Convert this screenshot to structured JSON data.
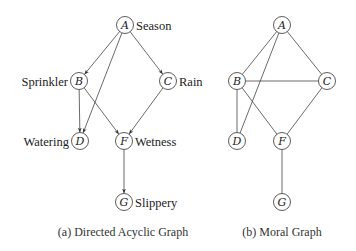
{
  "dag": {
    "caption": "(a) Directed Acyclic Graph",
    "nodes": [
      {
        "id": "A",
        "label": "A",
        "name": "Season",
        "x": 125,
        "y": 25,
        "name_side": "right"
      },
      {
        "id": "B",
        "label": "B",
        "name": "Sprinkler",
        "x": 79,
        "y": 81,
        "name_side": "left"
      },
      {
        "id": "C",
        "label": "C",
        "name": "Rain",
        "x": 168,
        "y": 81,
        "name_side": "right"
      },
      {
        "id": "D",
        "label": "D",
        "name": "Watering",
        "x": 80,
        "y": 141,
        "name_side": "left"
      },
      {
        "id": "F",
        "label": "F",
        "name": "Wetness",
        "x": 124,
        "y": 141,
        "name_side": "right"
      },
      {
        "id": "G",
        "label": "G",
        "name": "Slippery",
        "x": 124,
        "y": 202,
        "name_side": "right"
      }
    ],
    "edges": [
      {
        "from": "A",
        "to": "B"
      },
      {
        "from": "A",
        "to": "C"
      },
      {
        "from": "A",
        "to": "D"
      },
      {
        "from": "B",
        "to": "D"
      },
      {
        "from": "B",
        "to": "F"
      },
      {
        "from": "C",
        "to": "F"
      },
      {
        "from": "F",
        "to": "G"
      }
    ]
  },
  "moral": {
    "caption": "(b) Moral Graph",
    "nodes": [
      {
        "id": "A",
        "label": "A",
        "x": 282,
        "y": 25
      },
      {
        "id": "B",
        "label": "B",
        "x": 237,
        "y": 81
      },
      {
        "id": "C",
        "label": "C",
        "x": 327,
        "y": 81
      },
      {
        "id": "D",
        "label": "D",
        "x": 237,
        "y": 141
      },
      {
        "id": "F",
        "label": "F",
        "x": 282,
        "y": 141
      },
      {
        "id": "G",
        "label": "G",
        "x": 282,
        "y": 202
      }
    ],
    "edges": [
      {
        "from": "A",
        "to": "B"
      },
      {
        "from": "A",
        "to": "C"
      },
      {
        "from": "A",
        "to": "D"
      },
      {
        "from": "B",
        "to": "C"
      },
      {
        "from": "B",
        "to": "D"
      },
      {
        "from": "B",
        "to": "F"
      },
      {
        "from": "C",
        "to": "F"
      },
      {
        "from": "F",
        "to": "G"
      }
    ]
  }
}
